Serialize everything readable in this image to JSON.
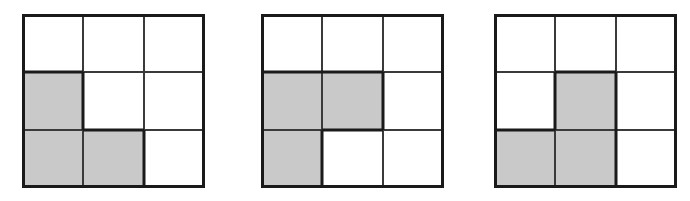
{
  "figure": {
    "background_color": "#ffffff",
    "width": 690,
    "height": 201,
    "grid_count": 3,
    "rows": 3,
    "columns": 3
  },
  "style": {
    "shaded_color": "#c9c9c9",
    "unshaded_color": "#ffffff",
    "border_color": "#1a1a1a",
    "inner_line_color": "#3a3a3a",
    "outer_border_width": 3,
    "inner_line_width": 2
  },
  "grids": [
    {
      "label": "grid-1",
      "x": 22,
      "y": 14,
      "width": 183,
      "height": 174,
      "shaded_cells": [
        {
          "row": 1,
          "col": 0
        },
        {
          "row": 2,
          "col": 0
        },
        {
          "row": 2,
          "col": 1
        }
      ],
      "cells": [
        [
          {
            "row": 0,
            "col": 0,
            "shaded": false
          },
          {
            "row": 0,
            "col": 1,
            "shaded": false
          },
          {
            "row": 0,
            "col": 2,
            "shaded": false
          }
        ],
        [
          {
            "row": 1,
            "col": 0,
            "shaded": true
          },
          {
            "row": 1,
            "col": 1,
            "shaded": false
          },
          {
            "row": 1,
            "col": 2,
            "shaded": false
          }
        ],
        [
          {
            "row": 2,
            "col": 0,
            "shaded": true
          },
          {
            "row": 2,
            "col": 1,
            "shaded": true
          },
          {
            "row": 2,
            "col": 2,
            "shaded": false
          }
        ]
      ],
      "shaded_count": 3
    },
    {
      "label": "grid-2",
      "x": 261,
      "y": 14,
      "width": 183,
      "height": 174,
      "shaded_cells": [
        {
          "row": 1,
          "col": 0
        },
        {
          "row": 1,
          "col": 1
        },
        {
          "row": 2,
          "col": 0
        }
      ],
      "cells": [
        [
          {
            "row": 0,
            "col": 0,
            "shaded": false
          },
          {
            "row": 0,
            "col": 1,
            "shaded": false
          },
          {
            "row": 0,
            "col": 2,
            "shaded": false
          }
        ],
        [
          {
            "row": 1,
            "col": 0,
            "shaded": true
          },
          {
            "row": 1,
            "col": 1,
            "shaded": true
          },
          {
            "row": 1,
            "col": 2,
            "shaded": false
          }
        ],
        [
          {
            "row": 2,
            "col": 0,
            "shaded": true
          },
          {
            "row": 2,
            "col": 1,
            "shaded": false
          },
          {
            "row": 2,
            "col": 2,
            "shaded": false
          }
        ]
      ],
      "shaded_count": 3
    },
    {
      "label": "grid-3",
      "x": 494,
      "y": 14,
      "width": 183,
      "height": 174,
      "shaded_cells": [
        {
          "row": 1,
          "col": 1
        },
        {
          "row": 2,
          "col": 0
        },
        {
          "row": 2,
          "col": 1
        }
      ],
      "cells": [
        [
          {
            "row": 0,
            "col": 0,
            "shaded": false
          },
          {
            "row": 0,
            "col": 1,
            "shaded": false
          },
          {
            "row": 0,
            "col": 2,
            "shaded": false
          }
        ],
        [
          {
            "row": 1,
            "col": 0,
            "shaded": false
          },
          {
            "row": 1,
            "col": 1,
            "shaded": true
          },
          {
            "row": 1,
            "col": 2,
            "shaded": false
          }
        ],
        [
          {
            "row": 2,
            "col": 0,
            "shaded": true
          },
          {
            "row": 2,
            "col": 1,
            "shaded": true
          },
          {
            "row": 2,
            "col": 2,
            "shaded": false
          }
        ]
      ],
      "shaded_count": 3
    }
  ]
}
